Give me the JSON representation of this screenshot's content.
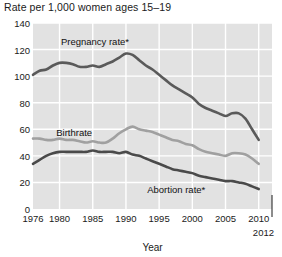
{
  "chart_data": {
    "type": "line",
    "title": "Rate per 1,000 women ages 15–19",
    "xlabel": "Year",
    "ylabel": "",
    "xlim": [
      1976,
      2012
    ],
    "ylim": [
      0,
      140
    ],
    "grid": true,
    "legend_position": "inline-annotations",
    "plot_background": "#e2e2e2",
    "gridline_color": "#ffffff",
    "yticks": [
      0,
      20,
      40,
      60,
      80,
      100,
      120,
      140
    ],
    "xticks": [
      1976,
      1980,
      1985,
      1990,
      1995,
      2000,
      2005,
      2010
    ],
    "xtick_end": "2012",
    "series": [
      {
        "name": "Pregnancy rate*",
        "color": "#5a5a5a",
        "label_x": 1980.2,
        "label_y": 126,
        "x": [
          1976,
          1977,
          1978,
          1979,
          1980,
          1981,
          1982,
          1983,
          1984,
          1985,
          1986,
          1987,
          1988,
          1989,
          1990,
          1991,
          1992,
          1993,
          1994,
          1995,
          1996,
          1997,
          1998,
          1999,
          2000,
          2001,
          2002,
          2003,
          2004,
          2005,
          2006,
          2007,
          2008,
          2009,
          2010
        ],
        "values": [
          101,
          104,
          105,
          108,
          110,
          110,
          109,
          107,
          107,
          108,
          107,
          109,
          111,
          114,
          117,
          116,
          112,
          108,
          105,
          101,
          97,
          93,
          90,
          87,
          84,
          79,
          76,
          74,
          72,
          70,
          72,
          72,
          68,
          60,
          52
        ]
      },
      {
        "name": "Birthrate",
        "color": "#a0a0a0",
        "label_x": 1979.5,
        "label_y": 57,
        "x": [
          1976,
          1977,
          1978,
          1979,
          1980,
          1981,
          1982,
          1983,
          1984,
          1985,
          1986,
          1987,
          1988,
          1989,
          1990,
          1991,
          1992,
          1993,
          1994,
          1995,
          1996,
          1997,
          1998,
          1999,
          2000,
          2001,
          2002,
          2003,
          2004,
          2005,
          2006,
          2007,
          2008,
          2009,
          2010
        ],
        "values": [
          53,
          53,
          52,
          52,
          53,
          52,
          52,
          51,
          50,
          51,
          50,
          50,
          53,
          57,
          60,
          62,
          60,
          59,
          58,
          56,
          54,
          52,
          51,
          49,
          48,
          45,
          43,
          42,
          41,
          40,
          42,
          42,
          41,
          38,
          34
        ]
      },
      {
        "name": "Abortion rate*",
        "color": "#4a4a4a",
        "label_x": 1993.2,
        "label_y": 14,
        "x": [
          1976,
          1977,
          1978,
          1979,
          1980,
          1981,
          1982,
          1983,
          1984,
          1985,
          1986,
          1987,
          1988,
          1989,
          1990,
          1991,
          1992,
          1993,
          1994,
          1995,
          1996,
          1997,
          1998,
          1999,
          2000,
          2001,
          2002,
          2003,
          2004,
          2005,
          2006,
          2007,
          2008,
          2009,
          2010
        ],
        "values": [
          34,
          37,
          40,
          42,
          43,
          43,
          43,
          43,
          43,
          44,
          43,
          43,
          43,
          42,
          43,
          41,
          40,
          38,
          36,
          34,
          32,
          30,
          29,
          28,
          27,
          25,
          24,
          23,
          22,
          21,
          21,
          20,
          19,
          17,
          15
        ]
      }
    ]
  }
}
